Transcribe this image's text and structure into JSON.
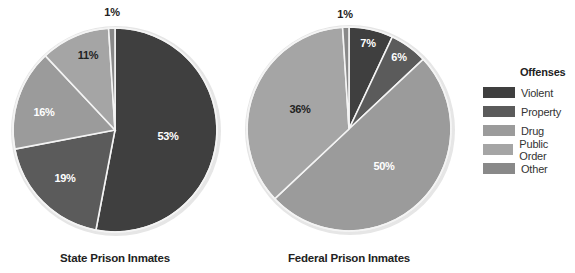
{
  "chart_data": {
    "type": "pie",
    "legend": {
      "title": "Offenses",
      "position": "right",
      "entries": [
        {
          "name": "Violent",
          "color": "#3f3f3f"
        },
        {
          "name": "Property",
          "color": "#5b5b5b"
        },
        {
          "name": "Drug",
          "color": "#9b9b9b"
        },
        {
          "name": "Public Order",
          "color": "#a5a5a5"
        },
        {
          "name": "Other",
          "color": "#898989"
        }
      ]
    },
    "pies": [
      {
        "title": "State Prison Inmates",
        "categories": [
          "Violent",
          "Property",
          "Drug",
          "Public Order",
          "Other"
        ],
        "values": [
          53,
          19,
          16,
          11,
          1
        ],
        "labels": [
          "53%",
          "19%",
          "16%",
          "11%",
          "1%"
        ],
        "label_colors": [
          "#ffffff",
          "#ffffff",
          "#ffffff",
          "#222222",
          "#222222"
        ],
        "center": [
          115,
          130
        ],
        "radius": 102,
        "title_pos": [
          115,
          252
        ],
        "label_pos": [
          [
            168,
            136
          ],
          [
            65,
            178
          ],
          [
            44,
            112
          ],
          [
            88,
            55
          ],
          [
            112,
            12
          ]
        ]
      },
      {
        "title": "Federal Prison Inmates",
        "categories": [
          "Violent",
          "Property",
          "Drug",
          "Public Order",
          "Other"
        ],
        "values": [
          7,
          6,
          50,
          36,
          1
        ],
        "labels": [
          "7%",
          "6%",
          "50%",
          "36%",
          "1%"
        ],
        "label_colors": [
          "#ffffff",
          "#ffffff",
          "#ffffff",
          "#222222",
          "#222222"
        ],
        "center": [
          349,
          129
        ],
        "radius": 102,
        "title_pos": [
          349,
          252
        ],
        "label_pos": [
          [
            368,
            43
          ],
          [
            399,
            57
          ],
          [
            384,
            166
          ],
          [
            300,
            109
          ],
          [
            345,
            14
          ]
        ]
      }
    ]
  }
}
